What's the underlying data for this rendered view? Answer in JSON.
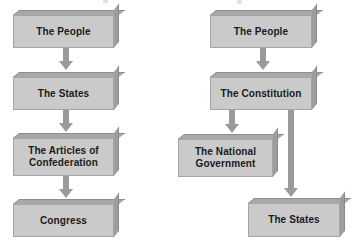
{
  "diagram": {
    "colors": {
      "box_face": "#cacaca",
      "box_top": "#a8a8a8",
      "box_side": "#9d9d9d",
      "box_outline": "#a5a5a5",
      "arrow": "#9a9a9a",
      "text": "#1b1b1b",
      "background": "#ffffff"
    },
    "columns": [
      {
        "name": "articles-of-confederation-chain",
        "nodes": [
          {
            "id": "left-the-people",
            "label": "The People"
          },
          {
            "id": "left-the-states",
            "label": "The States"
          },
          {
            "id": "left-the-articles-of-confederation",
            "label": "The Articles of\nConfederation"
          },
          {
            "id": "left-congress",
            "label": "Congress"
          }
        ],
        "connectors": [
          {
            "id": "left-arrow-people-to-states",
            "from": "left-the-people",
            "to": "left-the-states",
            "direction": "down"
          },
          {
            "id": "left-arrow-states-to-articles",
            "from": "left-the-states",
            "to": "left-the-articles-of-confederation",
            "direction": "down"
          },
          {
            "id": "left-arrow-articles-to-congress",
            "from": "left-the-articles-of-confederation",
            "to": "left-congress",
            "direction": "down"
          }
        ]
      },
      {
        "name": "constitution-chain",
        "nodes": [
          {
            "id": "right-the-people",
            "label": "The People"
          },
          {
            "id": "right-the-constitution",
            "label": "The Constitution"
          },
          {
            "id": "right-the-national-government",
            "label": "The National\nGovernment"
          },
          {
            "id": "right-the-states",
            "label": "The States"
          }
        ],
        "connectors": [
          {
            "id": "right-arrow-people-to-constitution",
            "from": "right-the-people",
            "to": "right-the-constitution",
            "direction": "down"
          },
          {
            "id": "right-arrow-constitution-to-national-government",
            "from": "right-the-constitution",
            "to": "right-the-national-government",
            "direction": "down"
          },
          {
            "id": "right-arrow-constitution-to-states",
            "from": "right-the-constitution",
            "to": "right-the-states",
            "direction": "down"
          }
        ]
      }
    ]
  }
}
